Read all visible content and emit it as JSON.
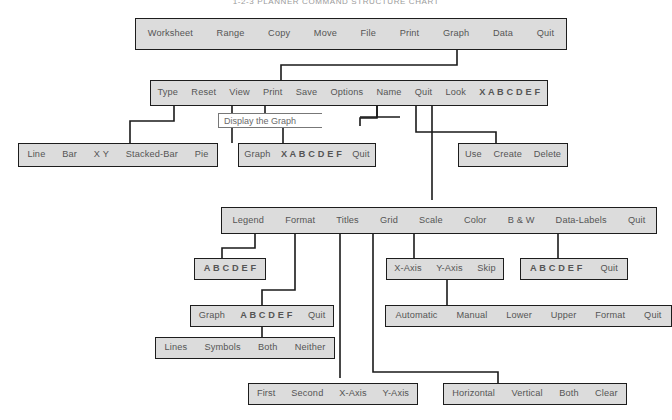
{
  "title": "1-2-3 PLANNER COMMAND STRUCTURE CHART",
  "colors": {
    "box_fill": "#dcdcdc",
    "box_border": "#1d1d1d",
    "item_text": "#555555",
    "line": "#1a1a1a",
    "callout_bg": "#ffffff",
    "background": "#ffffff"
  },
  "callout": {
    "text": "Display the Graph"
  },
  "menus": {
    "main": {
      "name": "main-menu",
      "items": [
        "Worksheet",
        "Range",
        "Copy",
        "Move",
        "File",
        "Print",
        "Graph",
        "Data",
        "Quit"
      ]
    },
    "graph": {
      "name": "graph-menu",
      "items": [
        "Type",
        "Reset",
        "View",
        "Print",
        "Save",
        "Options",
        "Name",
        "Quit",
        "Look",
        "X A B C D E F"
      ]
    },
    "type": {
      "name": "type-menu",
      "items": [
        "Line",
        "Bar",
        "X Y",
        "Stacked-Bar",
        "Pie"
      ]
    },
    "reset": {
      "name": "reset-menu",
      "items": [
        "Graph",
        "X A B C D E F",
        "Quit"
      ]
    },
    "name": {
      "name": "name-menu",
      "items": [
        "Use",
        "Create",
        "Delete"
      ]
    },
    "options": {
      "name": "options-menu",
      "items": [
        "Legend",
        "Format",
        "Titles",
        "Grid",
        "Scale",
        "Color",
        "B & W",
        "Data-Labels",
        "Quit"
      ]
    },
    "legend": {
      "name": "legend-menu",
      "items": [
        "A B C D E F"
      ]
    },
    "format": {
      "name": "format-menu",
      "items": [
        "Graph",
        "A B C D E F",
        "Quit"
      ]
    },
    "format_style": {
      "name": "format-style-menu",
      "items": [
        "Lines",
        "Symbols",
        "Both",
        "Neither"
      ]
    },
    "titles": {
      "name": "titles-menu",
      "items": [
        "First",
        "Second",
        "X-Axis",
        "Y-Axis"
      ]
    },
    "grid": {
      "name": "grid-menu",
      "items": [
        "Horizontal",
        "Vertical",
        "Both",
        "Clear"
      ]
    },
    "scale": {
      "name": "scale-menu",
      "items": [
        "X-Axis",
        "Y-Axis",
        "Skip"
      ]
    },
    "scale_axis": {
      "name": "scale-axis-menu",
      "items": [
        "Automatic",
        "Manual",
        "Lower",
        "Upper",
        "Format",
        "Quit"
      ]
    },
    "data_labels": {
      "name": "data-labels-menu",
      "items": [
        "A B C D E F",
        "Quit"
      ]
    }
  }
}
